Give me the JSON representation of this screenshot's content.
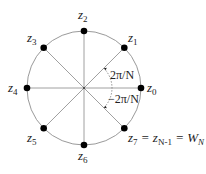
{
  "diagram": {
    "points": [
      {
        "id": "z0",
        "base": "z",
        "sub": "0",
        "angle_deg": 0
      },
      {
        "id": "z1",
        "base": "z",
        "sub": "1",
        "angle_deg": 45
      },
      {
        "id": "z2",
        "base": "z",
        "sub": "2",
        "angle_deg": 90
      },
      {
        "id": "z3",
        "base": "z",
        "sub": "3",
        "angle_deg": 135
      },
      {
        "id": "z4",
        "base": "z",
        "sub": "4",
        "angle_deg": 180
      },
      {
        "id": "z5",
        "base": "z",
        "sub": "5",
        "angle_deg": 225
      },
      {
        "id": "z6",
        "base": "z",
        "sub": "6",
        "angle_deg": 270
      },
      {
        "id": "z7",
        "base": "z",
        "sub": "7",
        "angle_deg": 315
      }
    ],
    "labels": {
      "z0_base": "z",
      "z0_sub": "0",
      "z1_base": "z",
      "z1_sub": "1",
      "z2_base": "z",
      "z2_sub": "2",
      "z3_base": "z",
      "z3_sub": "3",
      "z4_base": "z",
      "z4_sub": "4",
      "z5_base": "z",
      "z5_sub": "5",
      "z6_base": "z",
      "z6_sub": "6",
      "z7_base": "z",
      "z7_sub": "7",
      "eq1": " = ",
      "zN_base": "z",
      "zN_sub": "N-1",
      "eq2": " = ",
      "W_base": "W",
      "W_sub": "N",
      "angle_pos": "2π/N",
      "angle_neg": "−2π/N"
    },
    "colors": {
      "circle": "#9a9a9a",
      "spoke": "#a0a0a0",
      "dot": "#000000",
      "text": "#222222"
    }
  }
}
